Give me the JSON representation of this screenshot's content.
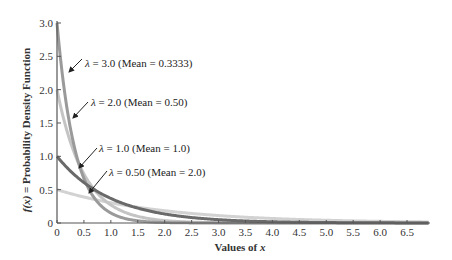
{
  "chart_data": {
    "type": "line",
    "title": "",
    "xlabel": "Values of x",
    "ylabel": "f(x) = Probability Density Function",
    "xlim": [
      0,
      6.9
    ],
    "ylim": [
      0,
      3.0
    ],
    "grid": false,
    "legend_position": "inline annotations with arrows",
    "x_ticks": [
      "0",
      "0.5",
      "1.0",
      "1.5",
      "2.0",
      "2.5",
      "3.0",
      "3.5",
      "4.0",
      "4.5",
      "5.0",
      "5.5",
      "6.0",
      "6.5"
    ],
    "y_ticks": [
      "0",
      "0.5",
      "1.0",
      "1.5",
      "2.0",
      "2.5",
      "3.0"
    ],
    "function": "f(x) = λ·e^(−λx)",
    "series": [
      {
        "name": "λ = 3.0 (Mean = 0.3333)",
        "lambda": 3.0,
        "mean": 0.3333,
        "color": "#9a9a9a",
        "x": [
          0,
          0.5,
          1.0,
          1.5,
          2.0,
          3.0,
          4.0,
          5.0,
          6.0,
          6.9
        ],
        "values": [
          3.0,
          0.669,
          0.149,
          0.033,
          0.007,
          0.0004,
          0.0,
          0.0,
          0.0,
          0.0
        ]
      },
      {
        "name": "λ = 2.0 (Mean = 0.50)",
        "lambda": 2.0,
        "mean": 0.5,
        "color": "#c4c4c4",
        "x": [
          0,
          0.5,
          1.0,
          1.5,
          2.0,
          3.0,
          4.0,
          5.0,
          6.0,
          6.9
        ],
        "values": [
          2.0,
          0.736,
          0.271,
          0.1,
          0.037,
          0.005,
          0.0007,
          0.0001,
          0.0,
          0.0
        ]
      },
      {
        "name": "λ = 1.0 (Mean = 1.0)",
        "lambda": 1.0,
        "mean": 1.0,
        "color": "#6a6a6a",
        "x": [
          0,
          0.5,
          1.0,
          1.5,
          2.0,
          3.0,
          4.0,
          5.0,
          6.0,
          6.9
        ],
        "values": [
          1.0,
          0.607,
          0.368,
          0.223,
          0.135,
          0.05,
          0.018,
          0.007,
          0.002,
          0.001
        ]
      },
      {
        "name": "λ = 0.50 (Mean = 2.0)",
        "lambda": 0.5,
        "mean": 2.0,
        "color": "#d2d2d2",
        "x": [
          0,
          0.5,
          1.0,
          1.5,
          2.0,
          3.0,
          4.0,
          5.0,
          6.0,
          6.9
        ],
        "values": [
          0.5,
          0.389,
          0.303,
          0.236,
          0.184,
          0.112,
          0.068,
          0.041,
          0.025,
          0.016
        ]
      }
    ]
  },
  "labels": {
    "xlabel_prefix": "Values of ",
    "xlabel_var": "x",
    "ylabel_fx": "f(x)",
    "ylabel_rest": " = Probability Density Function",
    "annotations": [
      {
        "lambda_sym": "λ",
        "text": " = 3.0 (Mean = 0.3333)"
      },
      {
        "lambda_sym": "λ",
        "text": " = 2.0 (Mean = 0.50)"
      },
      {
        "lambda_sym": "λ",
        "text": " = 1.0 (Mean = 1.0)"
      },
      {
        "lambda_sym": "λ",
        "text": " = 0.50 (Mean = 2.0)"
      }
    ],
    "x_ticks": [
      "0",
      "0.5",
      "1.0",
      "1.5",
      "2.0",
      "2.5",
      "3.0",
      "3.5",
      "4.0",
      "4.5",
      "5.0",
      "5.5",
      "6.0",
      "6.5"
    ],
    "y_ticks": [
      "0",
      "0.5",
      "1.0",
      "1.5",
      "2.0",
      "2.5",
      "3.0"
    ]
  }
}
